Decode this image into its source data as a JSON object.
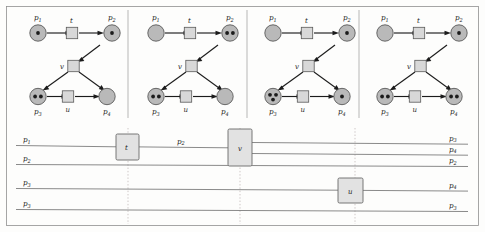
{
  "figure": {
    "width": 485,
    "height": 232,
    "colors": {
      "place_fill": "#b9b9b9",
      "transition_fill": "#d8d8d8",
      "process_transition_fill": "#e2e2e2",
      "arc_stroke": "#1c1c1c",
      "place_line_stroke": "#7d7d7d",
      "dotted_stroke": "#c2b9b9",
      "frame_stroke": "#8f8f8f",
      "token_fill": "#1c1c1c"
    }
  },
  "nets": [
    {
      "index": 1,
      "places": [
        {
          "id": "p1",
          "label": "p",
          "sub": "1",
          "tokens": 1
        },
        {
          "id": "p2",
          "label": "p",
          "sub": "2",
          "tokens": 1
        },
        {
          "id": "p3",
          "label": "p",
          "sub": "3",
          "tokens": 2
        },
        {
          "id": "p4",
          "label": "p",
          "sub": "4",
          "tokens": 0
        }
      ],
      "transitions": [
        {
          "id": "t",
          "label": "t"
        },
        {
          "id": "v",
          "label": "v"
        },
        {
          "id": "u",
          "label": "u"
        }
      ]
    },
    {
      "index": 2,
      "places": [
        {
          "id": "p1",
          "label": "p",
          "sub": "1",
          "tokens": 0
        },
        {
          "id": "p2",
          "label": "p",
          "sub": "2",
          "tokens": 2
        },
        {
          "id": "p3",
          "label": "p",
          "sub": "3",
          "tokens": 2
        },
        {
          "id": "p4",
          "label": "p",
          "sub": "4",
          "tokens": 0
        }
      ],
      "transitions": [
        {
          "id": "t",
          "label": "t"
        },
        {
          "id": "v",
          "label": "v"
        },
        {
          "id": "u",
          "label": "u"
        }
      ]
    },
    {
      "index": 3,
      "places": [
        {
          "id": "p1",
          "label": "p",
          "sub": "1",
          "tokens": 0
        },
        {
          "id": "p2",
          "label": "p",
          "sub": "2",
          "tokens": 1
        },
        {
          "id": "p3",
          "label": "p",
          "sub": "3",
          "tokens": 3
        },
        {
          "id": "p4",
          "label": "p",
          "sub": "4",
          "tokens": 1
        }
      ],
      "transitions": [
        {
          "id": "t",
          "label": "t"
        },
        {
          "id": "v",
          "label": "v"
        },
        {
          "id": "u",
          "label": "u"
        }
      ]
    },
    {
      "index": 4,
      "places": [
        {
          "id": "p1",
          "label": "p",
          "sub": "1",
          "tokens": 0
        },
        {
          "id": "p2",
          "label": "p",
          "sub": "2",
          "tokens": 1
        },
        {
          "id": "p3",
          "label": "p",
          "sub": "3",
          "tokens": 2
        },
        {
          "id": "p4",
          "label": "p",
          "sub": "4",
          "tokens": 2
        }
      ],
      "transitions": [
        {
          "id": "t",
          "label": "t"
        },
        {
          "id": "v",
          "label": "v"
        },
        {
          "id": "u",
          "label": "u"
        }
      ]
    }
  ],
  "process_net": {
    "left_labels": [
      {
        "label": "p",
        "sub": "1"
      },
      {
        "label": "p",
        "sub": "2"
      },
      {
        "label": "p",
        "sub": "3"
      },
      {
        "label": "p",
        "sub": "3"
      }
    ],
    "right_labels": [
      {
        "label": "p",
        "sub": "3"
      },
      {
        "label": "p",
        "sub": "4"
      },
      {
        "label": "p",
        "sub": "2"
      },
      {
        "label": "p",
        "sub": "4"
      },
      {
        "label": "p",
        "sub": "3"
      }
    ],
    "inline_labels": [
      {
        "label": "p",
        "sub": "2"
      }
    ],
    "transitions": [
      {
        "id": "t",
        "label": "t"
      },
      {
        "id": "v",
        "label": "v"
      },
      {
        "id": "u",
        "label": "u"
      }
    ]
  }
}
